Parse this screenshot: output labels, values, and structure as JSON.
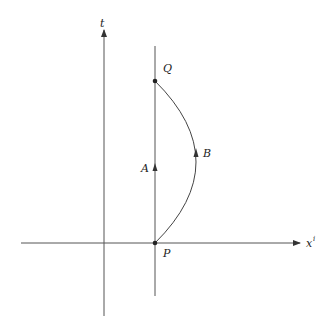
{
  "diagram": {
    "type": "spacetime-diagram",
    "axes": {
      "time": {
        "label": "t"
      },
      "space": {
        "label": "x",
        "superscript": "i"
      }
    },
    "points": [
      {
        "id": "Q",
        "label": "Q"
      },
      {
        "id": "P",
        "label": "P"
      }
    ],
    "paths": [
      {
        "id": "A",
        "label": "A",
        "description": "straight worldline from P to Q"
      },
      {
        "id": "B",
        "label": "B",
        "description": "curved worldline from P to Q"
      }
    ],
    "colors": {
      "line": "#333333",
      "background": "#ffffff"
    }
  }
}
